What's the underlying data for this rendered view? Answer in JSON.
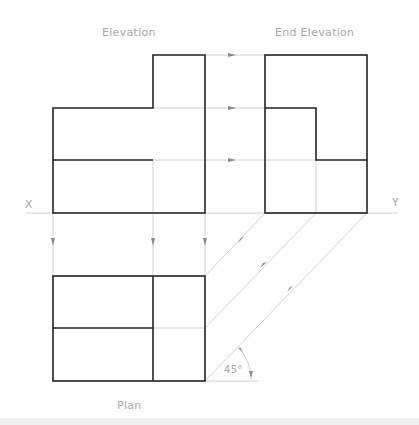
{
  "labels": {
    "elevation": "Elevation",
    "end_elevation": "End  Elevation",
    "plan": "Plan",
    "x_mark": "X",
    "y_mark": "Y",
    "angle": "45°"
  },
  "colors": {
    "outline": "#222222",
    "projection": "#bdbdbd",
    "text": "#a8a8a8"
  }
}
